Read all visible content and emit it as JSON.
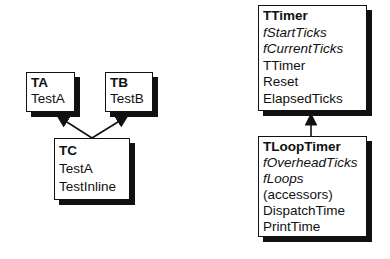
{
  "classes": {
    "ta": {
      "name": "TA",
      "members": [
        "TestA"
      ]
    },
    "tb": {
      "name": "TB",
      "members": [
        "TestB"
      ]
    },
    "tc": {
      "name": "TC",
      "members": [
        "TestA",
        "TestInline"
      ]
    },
    "ttimer": {
      "name": "TTimer",
      "fields": [
        "fStartTicks",
        "fCurrentTicks"
      ],
      "methods": [
        "TTimer",
        "Reset",
        "ElapsedTicks"
      ]
    },
    "tlooptimer": {
      "name": "TLoopTimer",
      "fields": [
        "fOverheadTicks",
        "fLoops"
      ],
      "methods": [
        "(accessors)",
        "DispatchTime",
        "PrintTime"
      ]
    }
  },
  "relations": [
    {
      "from": "TC",
      "to": "TA",
      "type": "inherits"
    },
    {
      "from": "TC",
      "to": "TB",
      "type": "inherits"
    },
    {
      "from": "TLoopTimer",
      "to": "TTimer",
      "type": "inherits"
    }
  ]
}
